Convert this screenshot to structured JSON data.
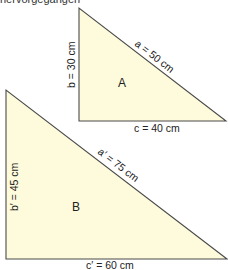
{
  "header": {
    "text": "hervorgegangen"
  },
  "triangles": [
    {
      "name": "A",
      "labels": {
        "a": "a = 50 cm",
        "b": "b = 30 cm",
        "c": "c = 40 cm"
      }
    },
    {
      "name": "B",
      "labels": {
        "a": "a′ = 75 cm",
        "b": "b′ = 45 cm",
        "c": "c′ = 60 cm"
      }
    }
  ],
  "colors": {
    "fill": "#fdfbdc",
    "stroke": "#4a4a4a"
  }
}
